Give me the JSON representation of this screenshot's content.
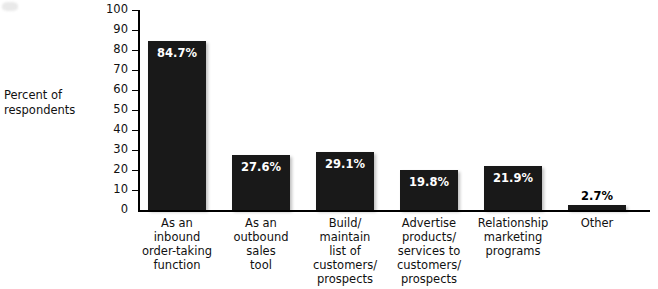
{
  "chart_data": {
    "type": "bar",
    "title": "",
    "xlabel": "",
    "ylabel": "Percent of respondents",
    "ylabel_lines": [
      "Percent of",
      "respondents"
    ],
    "ylim": [
      0,
      100
    ],
    "yticks": [
      0,
      10,
      20,
      30,
      40,
      50,
      60,
      70,
      80,
      90,
      100
    ],
    "ytick_labels": [
      "0",
      "10",
      "20",
      "30",
      "40",
      "50",
      "60",
      "70",
      "80",
      "90",
      "100"
    ],
    "grid": false,
    "legend": "none",
    "bar_color": "#191919",
    "categories": [
      "As an\ninbound\norder-taking\nfunction",
      "As an\noutbound\nsales\ntool",
      "Build/\nmaintain\nlist of\ncustomers/\nprospects",
      "Advertise\nproducts/\nservices to\ncustomers/\nprospects",
      "Relationship\nmarketing\nprograms",
      "Other"
    ],
    "values": [
      84.7,
      27.6,
      29.1,
      19.8,
      21.9,
      2.7
    ],
    "data_labels": [
      "84.7%",
      "27.6%",
      "29.1%",
      "19.8%",
      "21.9%",
      "2.7%"
    ],
    "data_label_placement": [
      "inside",
      "inside",
      "inside",
      "inside",
      "inside",
      "outside"
    ]
  }
}
